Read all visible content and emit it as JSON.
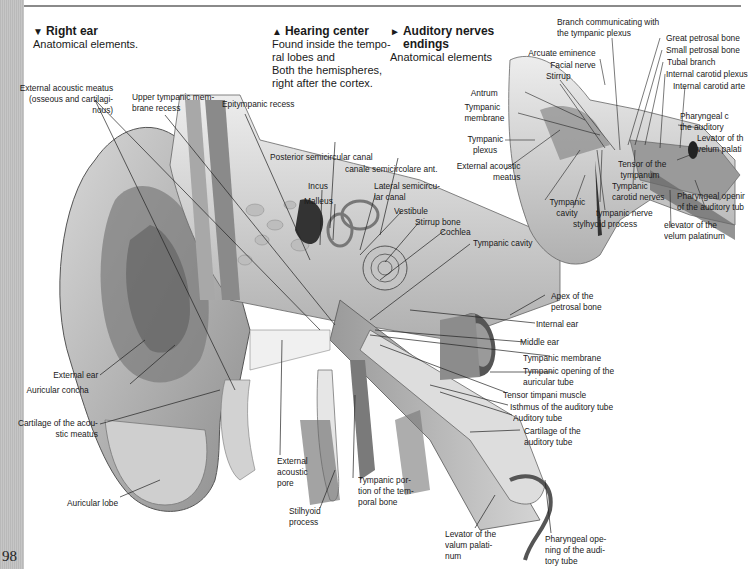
{
  "page": {
    "page_number": "98",
    "strip_color": "#c0c0c0",
    "rule_color": "#8a8a8a"
  },
  "headers": [
    {
      "glyph": "▼",
      "title": "Right ear",
      "lines": [
        "Anatomical elements."
      ]
    },
    {
      "glyph": "▲",
      "title": "Hearing center",
      "lines": [
        "Found inside the tempo-",
        "ral lobes and",
        "Both the hemispheres,",
        "right after the cortex."
      ]
    },
    {
      "glyph": "►",
      "title": "Auditory nerves",
      "title2": "endings",
      "lines": [
        "Anatomical elements"
      ]
    }
  ],
  "main_figure": {
    "labels": {
      "ext_meatus": [
        "External acoustic meatus",
        "(osseous and cartilagi-",
        "nous)"
      ],
      "upper_tymp": [
        "Upper tympanic mem-",
        "brane recess"
      ],
      "epitympanic": "Epitympanic recess",
      "post_semi": "Posterior semicircular canal",
      "ant_semi": "canale semicircolare ant.",
      "incus": "Incus",
      "malleus": "Malleus",
      "lateral_semi": [
        "Lateral semicircu-",
        "lar canal"
      ],
      "vestibule": "Vestibule",
      "stirrup_bone": "Stirrup bone",
      "cochlea": "Cochlea",
      "tympanic_cavity": "Tympanic cavity",
      "apex": [
        "Apex of the",
        "petrosal bone"
      ],
      "internal_ear": "Internal ear",
      "middle_ear": "Middle ear",
      "tymp_membrane": "Tympanic membrane",
      "tymp_opening": [
        "Tympanic opening of the",
        "auricular tube"
      ],
      "tensor": "Tensor timpani muscle",
      "isthmus": "Isthmus of the auditory tube",
      "auditory_tube": "Auditory tube",
      "cartilage_tube": [
        "Cartilage of the",
        "auditory tube"
      ],
      "pharyngeal": [
        "Pharyngeal ope-",
        "ning of the audi-",
        "tory tube"
      ],
      "levator": [
        "Levator of the",
        "valum palati-",
        "num"
      ],
      "tymp_portion": [
        "Tympanic por-",
        "tion of the tem-",
        "poral bone"
      ],
      "stilhyoid": [
        "Stilhyoid",
        "process"
      ],
      "ext_pore": [
        "External",
        "acoustic",
        "pore"
      ],
      "external_ear": "External ear",
      "concha": "Auricular concha",
      "cartilage_meatus": [
        "Cartilage of the acou-",
        "stic meatus"
      ],
      "lobe": "Auricular lobe"
    }
  },
  "inset_figure": {
    "labels": {
      "branch": [
        "Branch communicating with",
        "the tympanic plexus"
      ],
      "arcuate": "Arcuate eminence",
      "facial": "Facial nerve",
      "stirrup": "Stirrup",
      "antrum": "Antrum",
      "tymp_membrane": [
        "Tympanic",
        "membrane"
      ],
      "tymp_plexus": [
        "Tympanic",
        "plexus"
      ],
      "ext_meatus": [
        "External acoustic",
        "meatus"
      ],
      "tymp_cavity": [
        "Tympanic",
        "cavity"
      ],
      "tympanic_nerve": "tympanic nerve",
      "stylhyoid": "stylhyoid process",
      "tensor": [
        "Tensor of the",
        "tympanum"
      ],
      "carotid_nerves": [
        "Tympanic",
        "carotid nerves"
      ],
      "great_petrosal": "Great petrosal bone",
      "small_petrosal": "Small petrosal bone",
      "tubal": "Tubal branch",
      "carotid_plexus": "Internal carotid plexus",
      "carotid_artery": "Internal carotid arte",
      "pharyngeal_c": [
        "Pharyngeal c",
        "the auditory"
      ],
      "levator_v": [
        "Levator of th",
        "velum palati"
      ],
      "pharyngeal_open": [
        "Pharyngeal openir",
        "of the auditory tub"
      ],
      "elevator": [
        "elevator of the",
        "velum palatinum"
      ]
    }
  }
}
